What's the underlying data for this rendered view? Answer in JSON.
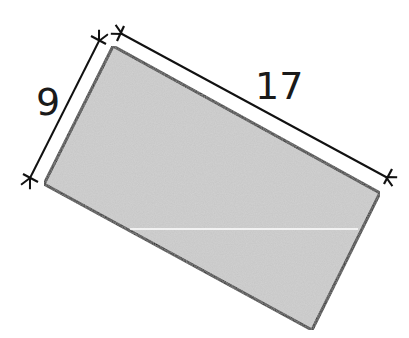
{
  "figure": {
    "shape": "rectangle",
    "fill_color": "#c6c6c6",
    "stroke_color": "#111111",
    "corners": {
      "top": [
        113,
        46
      ],
      "right": [
        380,
        193
      ],
      "bottom": [
        312,
        330
      ],
      "left": [
        44,
        184
      ]
    },
    "inner_line": {
      "x1": 130,
      "y1": 229,
      "x2": 358,
      "y2": 229,
      "color": "#ffffff"
    }
  },
  "dimensions": {
    "width": {
      "label": "9",
      "x": 36,
      "y": 115
    },
    "length": {
      "label": "17",
      "x": 256,
      "y": 99
    }
  }
}
